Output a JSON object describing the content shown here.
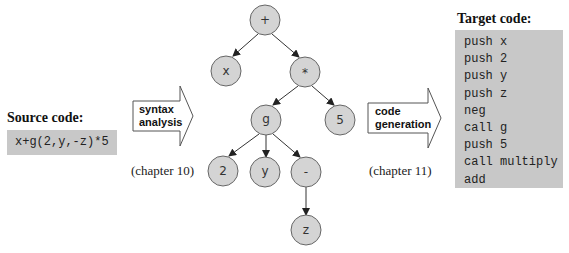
{
  "source": {
    "heading": "Source code:",
    "code": "x+g(2,y,-z)*5"
  },
  "syntax_arrow": {
    "line1": "syntax",
    "line2": "analysis",
    "chapter": "(chapter 10)"
  },
  "codegen_arrow": {
    "line1": "code",
    "line2": "generation",
    "chapter": "(chapter 11)"
  },
  "target": {
    "heading": "Target code:",
    "lines": [
      "push x",
      "push 2",
      "push y",
      "push z",
      "neg",
      "call g",
      "push 5",
      "call multiply",
      "add"
    ]
  },
  "tree": {
    "nodes": {
      "plus": "+",
      "x": "x",
      "times": "*",
      "g": "g",
      "five": "5",
      "two": "2",
      "y": "y",
      "minus": "-",
      "z": "z"
    }
  },
  "colors": {
    "node_fill": "#d4d4d4",
    "code_bg": "#c8c8c8",
    "edge": "#333333"
  }
}
